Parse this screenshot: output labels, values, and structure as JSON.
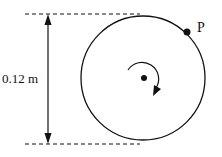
{
  "diagram": {
    "dimension_label": "0.12 m",
    "point_label": "P",
    "rotation_direction": "clockwise",
    "colors": {
      "stroke": "#111111",
      "background": "#ffffff"
    }
  }
}
